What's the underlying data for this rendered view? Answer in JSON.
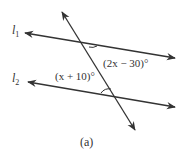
{
  "figure": {
    "caption": "(a)",
    "lines": [
      {
        "id": "l1",
        "label": "l",
        "subscript": "1"
      },
      {
        "id": "l2",
        "label": "l",
        "subscript": "2"
      }
    ],
    "angles": [
      {
        "id": "angle-top",
        "expression": "(2x − 30)°"
      },
      {
        "id": "angle-bottom",
        "expression": "(x + 10)°"
      }
    ],
    "colors": {
      "stroke": "#333333",
      "background": "#ffffff"
    }
  }
}
